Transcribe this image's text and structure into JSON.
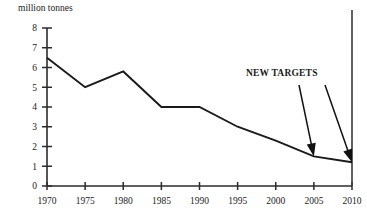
{
  "chart_data": {
    "type": "line",
    "title": "",
    "subtitle": "",
    "xlabel": "",
    "ylabel": "million tonnes",
    "x": [
      1970,
      1975,
      1980,
      1985,
      1990,
      1995,
      2000,
      2005,
      2010
    ],
    "values": [
      6.5,
      5.0,
      5.8,
      4.0,
      4.0,
      3.0,
      2.3,
      1.5,
      1.2
    ],
    "series": [
      {
        "name": "emissions",
        "values": [
          6.5,
          5.0,
          5.8,
          4.0,
          4.0,
          3.0,
          2.3,
          1.5,
          1.2
        ]
      }
    ],
    "xticklabels": [
      "1970",
      "1975",
      "1980",
      "1985",
      "1990",
      "1995",
      "2000",
      "2005",
      "2010"
    ],
    "yticklabels": [
      "0",
      "1",
      "2",
      "3",
      "4",
      "5",
      "6",
      "7",
      "8"
    ],
    "ytickvalues": [
      0,
      1,
      2,
      3,
      4,
      5,
      6,
      7,
      8
    ],
    "xlim": [
      1970,
      2010
    ],
    "ylim": [
      0,
      8
    ],
    "grid": false,
    "legend": false,
    "legend_position": "none",
    "line_color": "#1a1a1a",
    "axis_color": "#2b2b2b",
    "background_color": "#ffffff",
    "annotations": [
      {
        "label": "NEW TARGETS",
        "points_to": [
          {
            "x": 2005,
            "y": 1.5
          },
          {
            "x": 2010,
            "y": 1.2
          }
        ]
      }
    ],
    "reference_lines": [
      {
        "orientation": "vertical",
        "x": 2010
      }
    ]
  },
  "axis": {
    "y_title": "million tonnes",
    "y_ticks": [
      "8",
      "7",
      "6",
      "5",
      "4",
      "3",
      "2",
      "1",
      "0"
    ],
    "x_ticks": [
      "1970",
      "1975",
      "1980",
      "1985",
      "1990",
      "1995",
      "2000",
      "2005",
      "2010"
    ]
  },
  "annotation": {
    "new_targets_label": "NEW TARGETS"
  }
}
